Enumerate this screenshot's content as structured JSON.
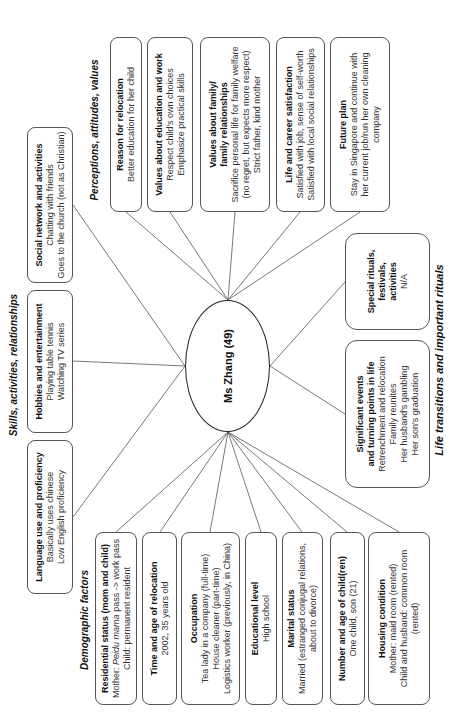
{
  "center": {
    "label": "Ms Zhang (49)"
  },
  "categories": {
    "skills": "Skills, activities, relationships",
    "perceptions": "Perceptions, attitudes, values",
    "demographic": "Demographic factors",
    "life": "Life transitions and important rituals"
  },
  "skills": {
    "language": {
      "title": "Language use and proficiency",
      "lines": [
        "Basically uses chinese",
        "Low English proficiency"
      ]
    },
    "hobbies": {
      "title": "Hobbies and entertainment",
      "lines": [
        "Playing table tennis",
        "Watching TV series"
      ]
    },
    "social": {
      "title": "Social network and activities",
      "lines": [
        "Chatting with friends",
        "Goes to the church (not as Christian)"
      ]
    }
  },
  "perceptions": {
    "reason": {
      "title": "Reason for relocation",
      "lines": [
        "Better education for her child"
      ]
    },
    "values_edu": {
      "title": "Values about education and work",
      "lines": [
        "Respect child's own choices",
        "Emphasize practical skills"
      ]
    },
    "values_family": {
      "title1": "Values about family/",
      "title2": "family relationships",
      "lines": [
        "Sacrifice personal life for family welfare",
        "(no regret, but expects more respect)",
        "Strict father, kind mother"
      ]
    },
    "life_career": {
      "title": "Life and career satisfaction",
      "lines": [
        "Satisfied with job, sense of self-worth",
        "Satisfied with local social relationships"
      ]
    },
    "future": {
      "title": "Future plan",
      "lines": [
        "Stay in Singapore and continue with",
        "her current job/run her own cleaning",
        "company"
      ]
    }
  },
  "life": {
    "special": {
      "title1": "Special rituals,",
      "title2": "festivals,",
      "title3": "activities",
      "lines": [
        "N/A"
      ]
    },
    "significant": {
      "title1": "Significant events",
      "title2": "and turning points in life",
      "lines": [
        "Retrenchment and relocation",
        "Family reunites",
        "Her husband's gambling",
        "Her son's graduation"
      ]
    }
  },
  "demographic": {
    "residential": {
      "title": "Residential status (mom and child)",
      "line1_prefix": "Mother: ",
      "line1_italic": "Peidu mama",
      "line1_suffix": " pass -> work pass",
      "line2": "Child: permanent resident"
    },
    "time": {
      "title": "Time and age of relocation",
      "lines": [
        "2002, 35 years old"
      ]
    },
    "occupation": {
      "title": "Occupation",
      "lines": [
        "Tea lady in a company (full-time)",
        "House cleaner (part-time)",
        "Logistics worker (previously, in China)"
      ]
    },
    "education": {
      "title": "Educational level",
      "lines": [
        "High school"
      ]
    },
    "marital": {
      "title": "Marital status",
      "lines": [
        "Married (estranged conjugal relations,",
        "about to divorce)"
      ]
    },
    "children": {
      "title": "Number and age of child(ren)",
      "lines": [
        "One child, son (21)"
      ]
    },
    "housing": {
      "title": "Housing condition",
      "lines": [
        "Mother: maid room (rented)",
        "Child and husband: common room",
        "(rented)"
      ]
    }
  }
}
